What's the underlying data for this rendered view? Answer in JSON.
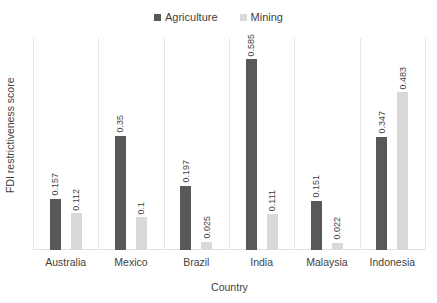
{
  "chart_data": {
    "type": "bar",
    "title": "",
    "xlabel": "Country",
    "ylabel": "FDI restrictiveness score",
    "categories": [
      "Australia",
      "Mexico",
      "Brazil",
      "India",
      "Malaysia",
      "Indonesia"
    ],
    "series": [
      {
        "name": "Agriculture",
        "color": "#595959",
        "values": [
          0.157,
          0.35,
          0.197,
          0.585,
          0.151,
          0.347
        ],
        "labels": [
          "0.157",
          "0.35",
          "0.197",
          "0.585",
          "0.151",
          "0.347"
        ]
      },
      {
        "name": "Mining",
        "color": "#d9d9d9",
        "values": [
          0.112,
          0.1,
          0.025,
          0.111,
          0.022,
          0.483
        ],
        "labels": [
          "0.112",
          "0.1",
          "0.025",
          "0.111",
          "0.022",
          "0.483"
        ]
      }
    ],
    "ylim": [
      0,
      0.65
    ],
    "grid": "vertical-category-separators",
    "legend_position": "top-center"
  }
}
